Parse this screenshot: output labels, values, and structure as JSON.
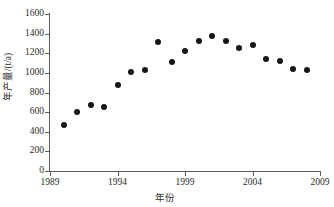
{
  "chart_data": {
    "type": "scatter",
    "title": "",
    "xlabel": "年份",
    "ylabel": "年产量/(t/a)",
    "xlim": [
      1989,
      2009
    ],
    "ylim": [
      0,
      1600
    ],
    "grid": false,
    "legend": null,
    "xticks": [
      "1989",
      "1994",
      "1999",
      "2004",
      "2009"
    ],
    "xtick_values": [
      1989,
      1994,
      1999,
      2004,
      2009
    ],
    "yticks": [
      "0",
      "200",
      "400",
      "600",
      "800",
      "1000",
      "1200",
      "1400",
      "1600"
    ],
    "ytick_values": [
      0,
      200,
      400,
      600,
      800,
      1000,
      1200,
      1400,
      1600
    ],
    "marker": "filled-circle",
    "marker_color": "#161616",
    "axis_color": "#5d5d5d",
    "x": [
      1990,
      1991,
      1992,
      1993,
      1994,
      1995,
      1996,
      1997,
      1998,
      1999,
      2000,
      2001,
      2002,
      2003,
      2004,
      2005,
      2006,
      2007,
      2008
    ],
    "values": [
      470,
      600,
      670,
      655,
      875,
      1005,
      1025,
      1310,
      1110,
      1225,
      1325,
      1380,
      1320,
      1250,
      1280,
      1140,
      1120,
      1040,
      1030
    ],
    "points": [
      {
        "x": 1990,
        "y": 470
      },
      {
        "x": 1991,
        "y": 600
      },
      {
        "x": 1992,
        "y": 670
      },
      {
        "x": 1993,
        "y": 655
      },
      {
        "x": 1994,
        "y": 875
      },
      {
        "x": 1995,
        "y": 1005
      },
      {
        "x": 1996,
        "y": 1025
      },
      {
        "x": 1997,
        "y": 1310
      },
      {
        "x": 1998,
        "y": 1110
      },
      {
        "x": 1999,
        "y": 1225
      },
      {
        "x": 2000,
        "y": 1325
      },
      {
        "x": 2001,
        "y": 1380
      },
      {
        "x": 2002,
        "y": 1320
      },
      {
        "x": 2003,
        "y": 1250
      },
      {
        "x": 2004,
        "y": 1280
      },
      {
        "x": 2005,
        "y": 1140
      },
      {
        "x": 2006,
        "y": 1120
      },
      {
        "x": 2007,
        "y": 1040
      },
      {
        "x": 2008,
        "y": 1030
      }
    ]
  }
}
